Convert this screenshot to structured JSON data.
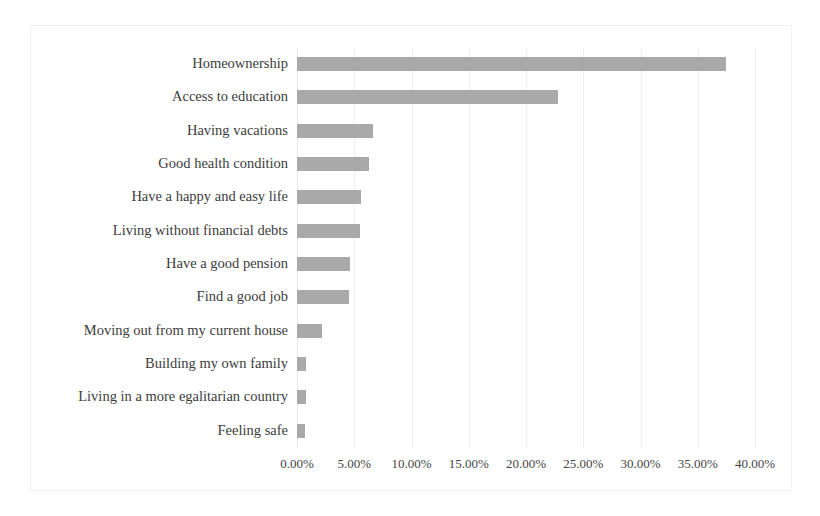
{
  "chart_data": {
    "type": "bar",
    "orientation": "horizontal",
    "title": "",
    "subtitle": "",
    "xlabel": "",
    "ylabel": "",
    "xlim": [
      0,
      40
    ],
    "xtick_labels": [
      "0.00%",
      "5.00%",
      "10.00%",
      "15.00%",
      "20.00%",
      "25.00%",
      "30.00%",
      "35.00%",
      "40.00%"
    ],
    "xtick_values": [
      0,
      5,
      10,
      15,
      20,
      25,
      30,
      35,
      40
    ],
    "value_suffix": "%",
    "grid": "vertical",
    "legend": "none",
    "bar_color": "#a9a9a9",
    "categories": [
      "Homeownership",
      "Access to education",
      "Having vacations",
      "Good health condition",
      "Have a happy and easy life",
      "Living without financial debts",
      "Have a good pension",
      "Find a good job",
      "Moving out from my current house",
      "Building my own family",
      "Living in a more egalitarian country",
      "Feeling safe"
    ],
    "values": [
      37.5,
      22.8,
      6.6,
      6.3,
      5.6,
      5.5,
      4.6,
      4.5,
      2.2,
      0.8,
      0.8,
      0.7
    ]
  },
  "colors": {
    "bar": "#a9a9a9",
    "grid": "#eeeeee",
    "border": "#f2f2f2",
    "text": "#3c3c3c",
    "background": "#ffffff"
  }
}
